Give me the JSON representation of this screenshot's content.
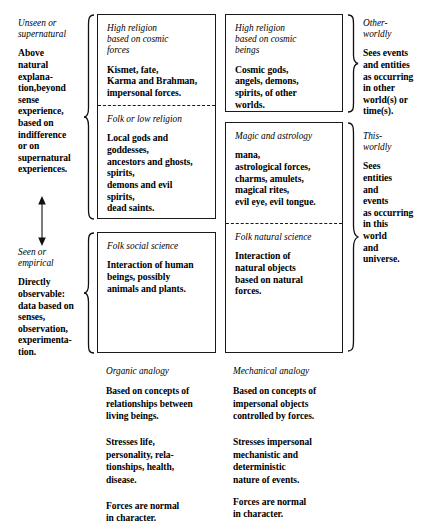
{
  "diagram": {
    "left_column": {
      "axis_top_label": "Unseen or\nsupernatural",
      "axis_top_body": "Above\nnatural\nexplana-\ntion,beyond\nsense\nexperience,\nbased on\nindifference\nor on\nsupernatural\nexperiences.",
      "axis_bottom_label": "Seen or\nempirical",
      "axis_bottom_body": "Directly\nobservable:\ndata based on\nsenses,\nobservation,\nexperimenta-\ntion.",
      "arrow_name": "double-headed-vertical-arrow"
    },
    "cells": [
      {
        "id": "high-religion-cosmic-forces",
        "heading": "High religion\nbased on cosmic\nforces",
        "body": "Kismet, fate,\nKarma and Brahman,\nimpersonal forces."
      },
      {
        "id": "folk-or-low-religion",
        "heading": "Folk or low religion",
        "body": "Local gods and\ngoddesses,\nancestors and ghosts,\nspirits,\ndemons and evil\nspirits,\ndead saints."
      },
      {
        "id": "high-religion-cosmic-beings",
        "heading": "High religion\nbased on cosmic\nbeings",
        "body": "Cosmic gods,\nangels, demons,\nspirits, of other\nworlds."
      },
      {
        "id": "magic-and-astrology",
        "heading": "Magic and astrology",
        "body": "mana,\nastrological forces,\ncharms, amulets,\nmagical rites,\nevil eye, evil tongue."
      },
      {
        "id": "folk-social-science",
        "heading": "Folk social science",
        "body": "Interaction of human\nbeings, possibly\nanimals and plants."
      },
      {
        "id": "folk-natural-science",
        "heading": "Folk natural science",
        "body": "Interaction of\nnatural objects\nbased on natural\nforces."
      }
    ],
    "right_column": [
      {
        "id": "other-worldly",
        "label": "Other-\nworldly",
        "body": "Sees events\nand entities\nas occurring\nin other\nworld(s) or\ntime(s)."
      },
      {
        "id": "this-worldly",
        "label": "This-\nworldly",
        "body": "Sees\nentities\nand\nevents\nas occurring\nin this\nworld\nand\nuniverse."
      }
    ],
    "bottom_columns": [
      {
        "id": "organic-analogy",
        "label": "Organic analogy",
        "paragraphs": [
          "Based on concepts of\nrelationships between\nliving beings.",
          "Stresses life,\npersonality, rela-\ntionships, health,\ndisease.",
          "Forces are normal\nin character."
        ]
      },
      {
        "id": "mechanical-analogy",
        "label": "Mechanical analogy",
        "paragraphs": [
          "Based on concepts of\nimpersonal objects\ncontrolled by forces.",
          "Stresses impersonal\nmechanistic and\ndeterministic\nnature of events.",
          "Forces are normal\nin character."
        ]
      }
    ],
    "colors": {
      "ink": "#000000",
      "rule": "#1a1a1a",
      "paper": "#ffffff"
    }
  }
}
